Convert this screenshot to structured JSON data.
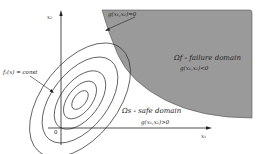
{
  "diagram": {
    "type": "reliability-limit-state",
    "axes": {
      "x_label": "x₁",
      "y_label": "x₂",
      "origin_label": "0"
    },
    "limit_state_label": "g(x₁,x₂)=0",
    "failure_domain": {
      "title": "Ωf - failure domain",
      "condition": "g(x₁,x₂)<0",
      "fill_color": "#9a9a9a"
    },
    "safe_domain": {
      "title": "Ωs - safe domain",
      "condition": "g(x₁,x₂)>0"
    },
    "density_contour_label": "fₓ(x) = const",
    "contour_count": 5,
    "line_color": "#333333"
  }
}
